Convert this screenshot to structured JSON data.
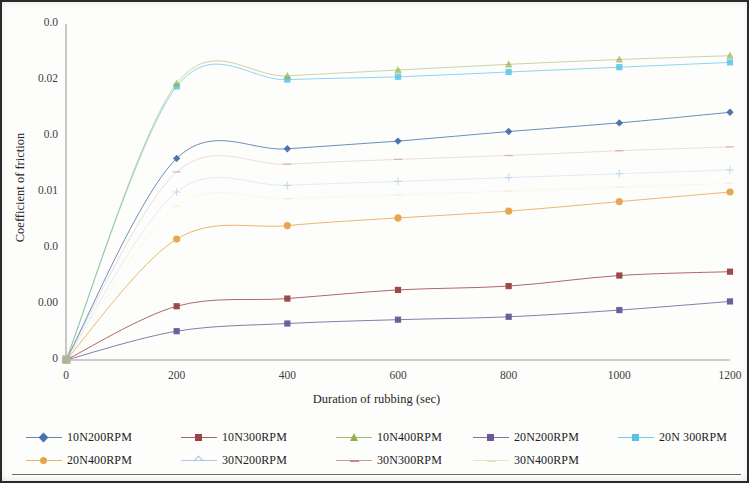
{
  "figure": {
    "type": "scanned-line-chart",
    "background_color": "#fdfdfc",
    "frame_color": "#2a2a2a"
  },
  "axes": {
    "y_title": "Coefficient of friction",
    "x_title": "Duration of rubbing (sec)",
    "y_tick_labels": [
      "0.0",
      "0.02",
      "0.0",
      "0.01",
      "0.0",
      "0.00",
      "0"
    ],
    "x_tick_labels": [
      "0",
      "200",
      "400",
      "600",
      "800",
      "1000",
      "1200"
    ]
  },
  "legend": {
    "rows": [
      [
        {
          "label": "10N200RPM",
          "color": "#4a72ab",
          "marker": "diamond"
        },
        {
          "label": "10N300RPM",
          "color": "#9c4444",
          "marker": "square"
        },
        {
          "label": "10N400RPM",
          "color": "#94b14a",
          "marker": "triangle"
        },
        {
          "label": "20N200RPM",
          "color": "#6b5a97",
          "marker": "square"
        },
        {
          "label": "20N 300RPM",
          "color": "#53c3e8",
          "marker": "square"
        }
      ],
      [
        {
          "label": "20N400RPM",
          "color": "#e8a44c",
          "marker": "circle"
        },
        {
          "label": "30N200RPM",
          "color": "#9fc3e0",
          "marker": "plus"
        },
        {
          "label": "30N300RPM",
          "color": "#c4868a",
          "marker": "dash"
        },
        {
          "label": "30N400RPM",
          "color": "#e6e3b0",
          "marker": "dash"
        }
      ]
    ]
  },
  "chart_data": {
    "type": "line",
    "title": "",
    "xlabel": "Duration of rubbing (sec)",
    "ylabel": "Coefficient of friction",
    "x": [
      0,
      200,
      400,
      600,
      800,
      1000,
      1200
    ],
    "xlim": [
      0,
      1200
    ],
    "ylim": [
      0,
      0.035
    ],
    "y_ticks": [
      0,
      0.005,
      0.01,
      0.015,
      0.02,
      0.025,
      0.03
    ],
    "y_tick_labels_as_printed": [
      "0",
      "0.00",
      "0.0",
      "0.01",
      "0.0",
      "0.02",
      "0.0"
    ],
    "grid": false,
    "legend_position": "bottom",
    "series": [
      {
        "name": "10N200RPM",
        "color": "#4a72ab",
        "marker": "diamond",
        "values": [
          0,
          0.021,
          0.022,
          0.0228,
          0.0238,
          0.0247,
          0.0258
        ]
      },
      {
        "name": "10N300RPM",
        "color": "#9c4444",
        "marker": "square",
        "values": [
          0,
          0.0056,
          0.0064,
          0.0073,
          0.0077,
          0.0088,
          0.0092
        ]
      },
      {
        "name": "10N400RPM",
        "color": "#94b14a",
        "marker": "triangle",
        "values": [
          0,
          0.0288,
          0.0296,
          0.0302,
          0.0308,
          0.0313,
          0.0317
        ]
      },
      {
        "name": "20N200RPM",
        "color": "#6b5a97",
        "marker": "square",
        "values": [
          0,
          0.003,
          0.0038,
          0.0042,
          0.0045,
          0.0052,
          0.0061
        ]
      },
      {
        "name": "20N 300RPM",
        "color": "#53c3e8",
        "marker": "square",
        "values": [
          0,
          0.0285,
          0.0292,
          0.0295,
          0.03,
          0.0305,
          0.031
        ]
      },
      {
        "name": "20N400RPM",
        "color": "#e8a44c",
        "marker": "circle",
        "values": [
          0,
          0.0126,
          0.014,
          0.0148,
          0.0155,
          0.0165,
          0.0175
        ]
      },
      {
        "name": "30N200RPM",
        "color": "#9fc3e0",
        "marker": "plus",
        "values": [
          0,
          0.0175,
          0.0182,
          0.0186,
          0.019,
          0.0194,
          0.0198
        ]
      },
      {
        "name": "30N300RPM",
        "color": "#c4868a",
        "marker": "dash",
        "values": [
          0,
          0.0196,
          0.0204,
          0.0209,
          0.0213,
          0.0218,
          0.0222
        ]
      },
      {
        "name": "30N400RPM",
        "color": "#e6e3b0",
        "marker": "dash",
        "values": [
          0,
          0.016,
          0.0168,
          0.0172,
          0.0176,
          0.018,
          0.0184
        ]
      }
    ]
  }
}
